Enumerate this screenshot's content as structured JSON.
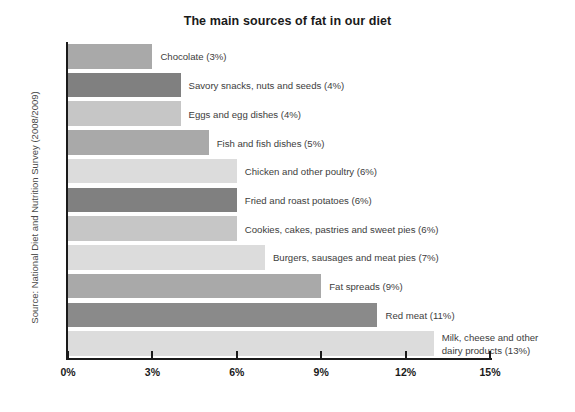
{
  "chart_data": {
    "type": "bar",
    "orientation": "horizontal",
    "title": "The main sources of fat in our diet",
    "xlabel": "",
    "ylabel": "",
    "source_note": "Source: National Diet and Nutrition Survey (2008/2009)",
    "xlim": [
      0,
      15
    ],
    "xticks": [
      "0%",
      "3%",
      "6%",
      "9%",
      "12%",
      "15%"
    ],
    "xtick_values": [
      0,
      3,
      6,
      9,
      12,
      15
    ],
    "grid": false,
    "legend": "none",
    "unit": "%",
    "categories": [
      "Chocolate",
      "Savory snacks, nuts and seeds",
      "Eggs and egg dishes",
      "Fish and fish dishes",
      "Chicken and other poultry",
      "Fried and roast potatoes",
      "Cookies, cakes, pastries and sweet pies",
      "Burgers, sausages and meat pies",
      "Fat spreads",
      "Red meat",
      "Milk, cheese and other dairy products"
    ],
    "values": [
      3,
      4,
      4,
      5,
      6,
      6,
      6,
      7,
      9,
      11,
      13
    ],
    "bars": [
      {
        "label": "Chocolate (3%)",
        "value": 3,
        "color": "#a9a9a9"
      },
      {
        "label": "Savory snacks, nuts and seeds (4%)",
        "value": 4,
        "color": "#808080"
      },
      {
        "label": "Eggs and egg dishes (4%)",
        "value": 4,
        "color": "#c6c6c6"
      },
      {
        "label": "Fish and fish dishes (5%)",
        "value": 5,
        "color": "#a9a9a9"
      },
      {
        "label": "Chicken and other poultry (6%)",
        "value": 6,
        "color": "#dcdcdc"
      },
      {
        "label": "Fried and roast potatoes (6%)",
        "value": 6,
        "color": "#808080"
      },
      {
        "label": "Cookies, cakes, pastries and sweet pies (6%)",
        "value": 6,
        "color": "#c6c6c6"
      },
      {
        "label": "Burgers, sausages and meat pies (7%)",
        "value": 7,
        "color": "#dcdcdc"
      },
      {
        "label": "Fat spreads (9%)",
        "value": 9,
        "color": "#a9a9a9"
      },
      {
        "label": "Red meat (11%)",
        "value": 11,
        "color": "#8a8a8a"
      },
      {
        "label": "Milk, cheese and other dairy products (13%)",
        "value": 13,
        "color": "#dcdcdc"
      }
    ]
  },
  "colors": {
    "axis": "#1a1a1a",
    "title_text": "#1a1a1a",
    "label_text": "#3d3d3d",
    "background": "#ffffff"
  }
}
